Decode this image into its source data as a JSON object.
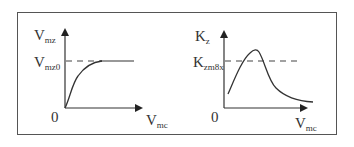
{
  "left_chart": {
    "y_axis_label": {
      "main": "V",
      "sub": "mz"
    },
    "ref_label": {
      "main": "V",
      "sub": "mz0"
    },
    "origin_label": "0",
    "x_axis_label": {
      "main": "V",
      "sub": "mc"
    },
    "curve": "saturating rise to V_mz0 asymptote"
  },
  "right_chart": {
    "y_axis_label": {
      "main": "K",
      "sub": "z"
    },
    "ref_label": {
      "main": "K",
      "sub": "zm8x"
    },
    "origin_label": "0",
    "x_axis_label": {
      "main": "V",
      "sub": "mc"
    },
    "curve": "rise to peak above K_zm8x then decay"
  },
  "colors": {
    "line": "#333333",
    "frame": "#555555"
  }
}
